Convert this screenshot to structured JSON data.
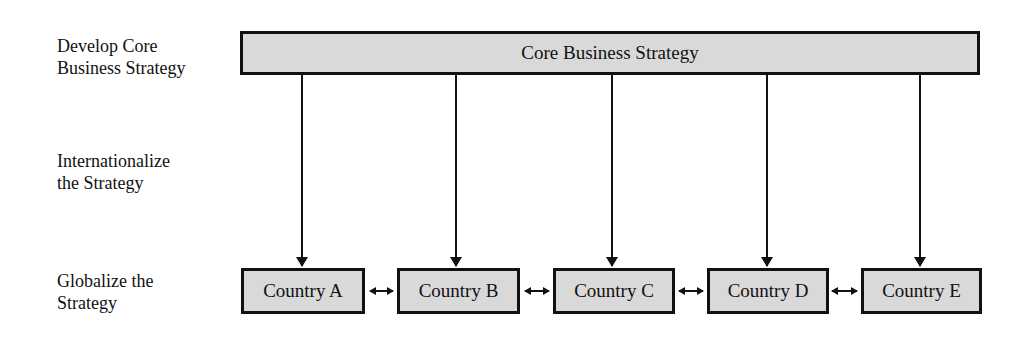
{
  "stages": [
    {
      "lines": [
        "Develop Core",
        "Business Strategy"
      ]
    },
    {
      "lines": [
        "Internationalize",
        "the Strategy"
      ]
    },
    {
      "lines": [
        "Globalize the",
        "Strategy"
      ]
    }
  ],
  "core": {
    "label": "Core Business Strategy"
  },
  "countries": [
    {
      "label": "Country A"
    },
    {
      "label": "Country B"
    },
    {
      "label": "Country C"
    },
    {
      "label": "Country D"
    },
    {
      "label": "Country E"
    }
  ],
  "colors": {
    "box_fill": "#d9d9d9",
    "stroke": "#111111"
  }
}
